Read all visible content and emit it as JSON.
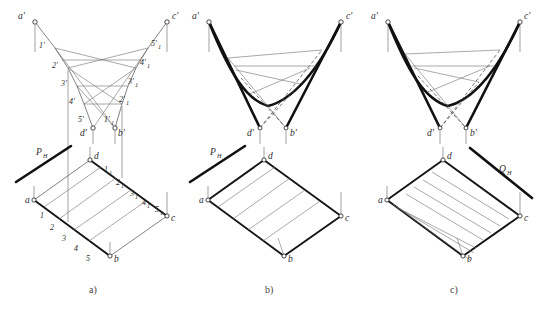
{
  "figure": {
    "background": "#ffffff",
    "ink_color": "#111111",
    "thin_color": "#6f6f6f",
    "dash_color": "#4a4a4a"
  },
  "captions": [
    {
      "id": "cap-a",
      "label": "a)",
      "x": 95,
      "y": 292
    },
    {
      "id": "cap-b",
      "label": "b)",
      "x": 271,
      "y": 292
    },
    {
      "id": "cap-c",
      "label": "c)",
      "x": 456,
      "y": 292
    }
  ],
  "panels": [
    {
      "id": "panel-a",
      "caption": "a)",
      "elevation": {
        "corner_labels": [
          "a'",
          "c'",
          "d'",
          "b'"
        ],
        "left_ruling_labels": [
          "1'",
          "2'",
          "3'",
          "4'",
          "5'"
        ],
        "right_ruling_labels": [
          "1'",
          "2'",
          "3'",
          "4'",
          "5'"
        ],
        "right_ruling_subscripts": [
          "1",
          "1",
          "1",
          "1",
          "1"
        ]
      },
      "plan": {
        "corner_labels": [
          "a",
          "b",
          "c",
          "d"
        ],
        "edge_ab_labels": [
          "1",
          "2",
          "3",
          "4",
          "5"
        ],
        "edge_dc_labels": [
          "1",
          "2",
          "3",
          "4",
          "5"
        ],
        "edge_dc_subscripts": [
          "1",
          "1",
          "1",
          "1",
          "1"
        ],
        "trace_label": "P",
        "trace_subscript": "H"
      }
    },
    {
      "id": "panel-b",
      "caption": "b)",
      "elevation": {
        "corner_labels": [
          "a'",
          "c'",
          "d'",
          "b'"
        ]
      },
      "plan": {
        "corner_labels": [
          "a",
          "b",
          "c",
          "d"
        ],
        "trace_label": "P",
        "trace_subscript": "H"
      }
    },
    {
      "id": "panel-c",
      "caption": "c)",
      "elevation": {
        "corner_labels": [
          "a'",
          "c'",
          "d'",
          "b'"
        ]
      },
      "plan": {
        "corner_labels": [
          "a",
          "b",
          "c",
          "d"
        ],
        "trace_label": "Q",
        "trace_subscript": "H"
      }
    }
  ],
  "geometry": {
    "panel_a": {
      "elevation_points": {
        "a_prime": [
          35,
          22
        ],
        "c_prime": [
          167,
          22
        ],
        "d_prime": [
          93,
          128
        ],
        "b_prime": [
          115,
          128
        ]
      },
      "plan_points": {
        "a": [
          34,
          200
        ],
        "b": [
          110,
          256
        ],
        "c": [
          167,
          216
        ],
        "d": [
          90,
          160
        ]
      }
    },
    "panel_b": {
      "elevation_points": {
        "a_prime": [
          209,
          22
        ],
        "c_prime": [
          341,
          22
        ],
        "d_prime": [
          260,
          128
        ],
        "b_prime": [
          286,
          128
        ]
      },
      "plan_points": {
        "a": [
          208,
          200
        ],
        "b": [
          284,
          256
        ],
        "c": [
          341,
          216
        ],
        "d": [
          264,
          160
        ]
      }
    },
    "panel_c": {
      "elevation_points": {
        "a_prime": [
          388,
          22
        ],
        "c_prime": [
          520,
          22
        ],
        "d_prime": [
          440,
          128
        ],
        "b_prime": [
          466,
          128
        ]
      },
      "plan_points": {
        "a": [
          387,
          200
        ],
        "b": [
          463,
          256
        ],
        "c": [
          520,
          216
        ],
        "d": [
          443,
          160
        ]
      }
    }
  }
}
